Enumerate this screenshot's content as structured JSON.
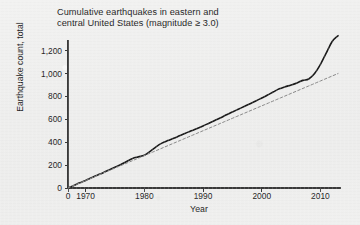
{
  "figure": {
    "background_color": "#eeeeee",
    "ink_color": "#242424"
  },
  "chart_data": {
    "type": "line",
    "title": "Cumulative earthquakes in eastern and\ncentral United States (magnitude ≥ 3.0)",
    "xlabel": "Year",
    "ylabel": "Earthquake count, total",
    "xlim": [
      1967,
      2013.5
    ],
    "ylim": [
      0,
      1380
    ],
    "grid": false,
    "legend": null,
    "xticks": [
      {
        "value": 1967,
        "label": "0"
      },
      {
        "value": 1970,
        "label": "1970"
      },
      {
        "value": 1980,
        "label": "1980"
      },
      {
        "value": 1990,
        "label": "1990"
      },
      {
        "value": 2000,
        "label": "2000"
      },
      {
        "value": 2010,
        "label": "2010"
      }
    ],
    "yticks": [
      {
        "value": 0,
        "label": "0"
      },
      {
        "value": 200,
        "label": "200"
      },
      {
        "value": 400,
        "label": "400"
      },
      {
        "value": 600,
        "label": "600"
      },
      {
        "value": 800,
        "label": "800"
      },
      {
        "value": 1000,
        "label": "1,000"
      },
      {
        "value": 1200,
        "label": "1,200"
      }
    ],
    "series": [
      {
        "name": "Cumulative earthquake count",
        "style": "solid",
        "color": "#1a1a1a",
        "width": 1.6,
        "x": [
          1967,
          1968,
          1969,
          1970,
          1971,
          1972,
          1973,
          1974,
          1975,
          1976,
          1977,
          1978,
          1979,
          1980,
          1981,
          1982,
          1983,
          1984,
          1985,
          1986,
          1987,
          1988,
          1989,
          1990,
          1991,
          1992,
          1993,
          1994,
          1995,
          1996,
          1997,
          1998,
          1999,
          2000,
          2001,
          2002,
          2003,
          2004,
          2005,
          2006,
          2007,
          2008,
          2009,
          2010,
          2011,
          2012,
          2013
        ],
        "y": [
          0,
          22,
          45,
          66,
          90,
          112,
          134,
          158,
          182,
          205,
          232,
          258,
          272,
          286,
          320,
          360,
          392,
          414,
          434,
          456,
          478,
          500,
          520,
          542,
          566,
          590,
          614,
          640,
          664,
          688,
          712,
          736,
          760,
          786,
          812,
          840,
          866,
          884,
          900,
          918,
          940,
          952,
          1000,
          1080,
          1180,
          1280,
          1330
        ]
      },
      {
        "name": "Linear trend (1967–2013)",
        "style": "dashed",
        "color": "#8a8a8a",
        "width": 1.0,
        "x": [
          1967,
          2013
        ],
        "y": [
          0,
          1000
        ]
      }
    ]
  }
}
